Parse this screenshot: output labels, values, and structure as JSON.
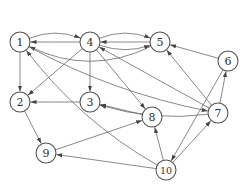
{
  "diagram": {
    "type": "directed-graph",
    "node_radius": 10,
    "nodes": [
      {
        "id": "1",
        "label": "1",
        "x": 20,
        "y": 42
      },
      {
        "id": "2",
        "label": "2",
        "x": 20,
        "y": 102
      },
      {
        "id": "3",
        "label": "3",
        "x": 90,
        "y": 102
      },
      {
        "id": "4",
        "label": "4",
        "x": 90,
        "y": 42
      },
      {
        "id": "5",
        "label": "5",
        "x": 160,
        "y": 42
      },
      {
        "id": "6",
        "label": "6",
        "x": 228,
        "y": 61
      },
      {
        "id": "7",
        "label": "7",
        "x": 218,
        "y": 113
      },
      {
        "id": "8",
        "label": "8",
        "x": 152,
        "y": 117
      },
      {
        "id": "9",
        "label": "9",
        "x": 46,
        "y": 153
      },
      {
        "id": "10",
        "label": "10",
        "x": 166,
        "y": 170
      }
    ],
    "edges": [
      {
        "from": "5",
        "to": "1",
        "curve": -34
      },
      {
        "from": "1",
        "to": "4",
        "curve": -14
      },
      {
        "from": "4",
        "to": "1",
        "curve": 0
      },
      {
        "from": "4",
        "to": "5",
        "curve": -14
      },
      {
        "from": "5",
        "to": "4",
        "curve": 0
      },
      {
        "from": "4",
        "to": "5",
        "curve": 12
      },
      {
        "from": "1",
        "to": "2",
        "curve": 0
      },
      {
        "from": "4",
        "to": "2",
        "curve": 0
      },
      {
        "from": "4",
        "to": "3",
        "curve": 0
      },
      {
        "from": "4",
        "to": "8",
        "curve": 0
      },
      {
        "from": "3",
        "to": "2",
        "curve": 0
      },
      {
        "from": "6",
        "to": "5",
        "curve": 0
      },
      {
        "from": "7",
        "to": "6",
        "curve": 0
      },
      {
        "from": "7",
        "to": "5",
        "curve": 0
      },
      {
        "from": "7",
        "to": "4",
        "curve": 0
      },
      {
        "from": "7",
        "to": "3",
        "curve": -14
      },
      {
        "from": "1",
        "to": "7",
        "curve": 16
      },
      {
        "from": "8",
        "to": "3",
        "curve": 0
      },
      {
        "from": "6",
        "to": "10",
        "curve": 0
      },
      {
        "from": "10",
        "to": "7",
        "curve": 0
      },
      {
        "from": "10",
        "to": "8",
        "curve": 0
      },
      {
        "from": "10",
        "to": "9",
        "curve": 0
      },
      {
        "from": "10",
        "to": "1",
        "curve": -20
      },
      {
        "from": "2",
        "to": "9",
        "curve": 0
      },
      {
        "from": "9",
        "to": "8",
        "curve": 0
      }
    ]
  }
}
